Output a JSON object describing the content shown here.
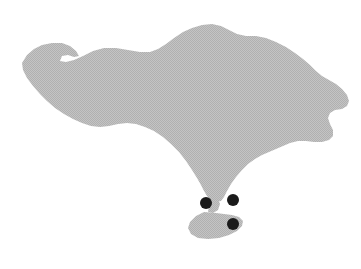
{
  "figure": {
    "name": "bali-island-map",
    "width": 361,
    "height": 269,
    "background_color": "#ffffff",
    "title": "",
    "caption": ""
  },
  "map_data": {
    "type": "silhouette-map",
    "region_name": "Bali",
    "projection": "none",
    "land": {
      "name": "bali-landmass",
      "fill_color": "#bcbcbc",
      "stroke": "none",
      "texture": "dither-halftone",
      "parts": [
        {
          "name": "bali-mainland",
          "path": "M 22,63 L 27,55 L 34,49 L 42,45 L 52,43 L 62,43 L 70,46 L 76,51 L 79,56 L 74,57 L 68,55 L 62,56 L 60,61 L 66,62 L 74,60 L 83,56 L 93,51 L 104,48 L 116,48 L 128,50 L 140,52 L 150,52 L 158,49 L 166,44 L 174,38 L 183,32 L 192,28 L 202,25 L 212,24 L 221,26 L 229,30 L 237,34 L 246,36 L 256,36 L 266,38 L 276,42 L 286,47 L 295,53 L 303,59 L 310,65 L 316,71 L 322,76 L 329,80 L 336,84 L 342,89 L 347,95 L 349,101 L 347,106 L 342,109 L 335,110 L 330,113 L 328,118 L 330,124 L 333,130 L 333,136 L 329,140 L 322,142 L 314,142 L 306,141 L 298,141 L 290,143 L 283,146 L 276,149 L 269,152 L 262,155 L 255,159 L 248,164 L 242,170 L 236,177 L 231,184 L 227,191 L 224,197 L 221,201 L 216,202 L 211,200 L 207,196 L 204,191 L 201,185 L 197,178 L 192,170 L 186,161 L 179,152 L 171,144 L 163,137 L 154,131 L 145,127 L 136,124 L 127,123 L 118,124 L 109,126 L 100,127 L 91,126 L 82,123 L 73,119 L 64,114 L 55,108 L 47,101 L 40,94 L 33,86 L 27,78 L 23,70 Z"
        },
        {
          "name": "bukit-peninsula",
          "path": "M 204,212 L 196,216 L 190,222 L 188,228 L 191,234 L 198,238 L 208,239 L 219,238 L 229,235 L 237,231 L 242,226 L 243,221 L 239,217 L 232,215 L 224,214 L 216,213 Z"
        },
        {
          "name": "isthmus-bridge",
          "path": "M 212,200 L 209,206 L 208,212 L 213,213 L 218,210 L 220,204 L 218,199 Z"
        }
      ]
    },
    "markers": [
      {
        "name": "marker-west",
        "label": "",
        "x": 206,
        "y": 203,
        "radius": 6,
        "color": "#1a1a1a"
      },
      {
        "name": "marker-northeast",
        "label": "",
        "x": 233,
        "y": 200,
        "radius": 6,
        "color": "#1a1a1a"
      },
      {
        "name": "marker-south",
        "label": "",
        "x": 233,
        "y": 224,
        "radius": 6,
        "color": "#1a1a1a"
      }
    ],
    "legend": {
      "visible": false,
      "entries": []
    },
    "labels": [],
    "scale_bar": {
      "visible": false,
      "text": ""
    },
    "north_arrow": {
      "visible": false
    }
  }
}
